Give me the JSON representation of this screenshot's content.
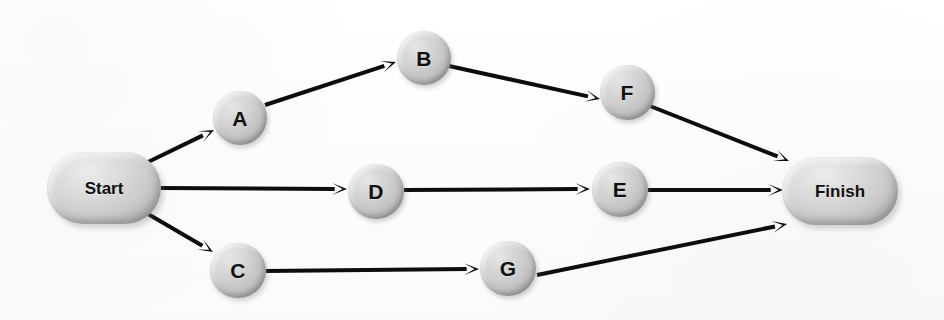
{
  "diagram": {
    "type": "directed-graph",
    "canvas": {
      "width": 944,
      "height": 320
    },
    "style": {
      "background_color": "#fdfdfd",
      "node_fill_color": "#c8c8c8",
      "node_highlight_color": "#e9e9e9",
      "node_shadow_color": "#9a9a9a",
      "edge_color": "#0d0d0d",
      "label_color": "#111111",
      "edge_width": 4,
      "arrowhead_length": 15
    },
    "nodes": [
      {
        "id": "start",
        "label": "Start",
        "shape": "stadium",
        "cx": 104,
        "cy": 188,
        "w": 114,
        "h": 72
      },
      {
        "id": "a",
        "label": "A",
        "shape": "circle",
        "cx": 240,
        "cy": 118,
        "w": 54,
        "h": 54
      },
      {
        "id": "b",
        "label": "B",
        "shape": "circle",
        "cx": 424,
        "cy": 58,
        "w": 54,
        "h": 54
      },
      {
        "id": "f",
        "label": "F",
        "shape": "circle",
        "cx": 627,
        "cy": 92,
        "w": 55,
        "h": 55
      },
      {
        "id": "d",
        "label": "D",
        "shape": "circle",
        "cx": 376,
        "cy": 191,
        "w": 56,
        "h": 55
      },
      {
        "id": "e",
        "label": "E",
        "shape": "circle",
        "cx": 620,
        "cy": 189,
        "w": 56,
        "h": 55
      },
      {
        "id": "c",
        "label": "C",
        "shape": "circle",
        "cx": 238,
        "cy": 270,
        "w": 56,
        "h": 55
      },
      {
        "id": "g",
        "label": "G",
        "shape": "circle",
        "cx": 508,
        "cy": 268,
        "w": 56,
        "h": 55
      },
      {
        "id": "finish",
        "label": "Finish",
        "shape": "stadium",
        "cx": 840,
        "cy": 191,
        "w": 116,
        "h": 68
      }
    ],
    "edges": [
      {
        "id": "start-a",
        "from": "Start",
        "to": "A",
        "x1": 146,
        "y1": 163,
        "x2": 214,
        "y2": 130
      },
      {
        "id": "a-b",
        "from": "A",
        "to": "B",
        "x1": 265,
        "y1": 105,
        "x2": 396,
        "y2": 62
      },
      {
        "id": "b-f",
        "from": "B",
        "to": "F",
        "x1": 449,
        "y1": 66,
        "x2": 600,
        "y2": 99
      },
      {
        "id": "f-finish",
        "from": "F",
        "to": "Finish",
        "x1": 650,
        "y1": 106,
        "x2": 789,
        "y2": 161
      },
      {
        "id": "start-d",
        "from": "Start",
        "to": "D",
        "x1": 160,
        "y1": 188,
        "x2": 347,
        "y2": 189
      },
      {
        "id": "d-e",
        "from": "D",
        "to": "E",
        "x1": 404,
        "y1": 190,
        "x2": 590,
        "y2": 189
      },
      {
        "id": "e-finish",
        "from": "E",
        "to": "Finish",
        "x1": 648,
        "y1": 190,
        "x2": 783,
        "y2": 190
      },
      {
        "id": "start-c",
        "from": "Start",
        "to": "C",
        "x1": 148,
        "y1": 214,
        "x2": 213,
        "y2": 252
      },
      {
        "id": "c-g",
        "from": "C",
        "to": "G",
        "x1": 266,
        "y1": 271,
        "x2": 479,
        "y2": 269
      },
      {
        "id": "g-finish",
        "from": "G",
        "to": "Finish",
        "x1": 537,
        "y1": 275,
        "x2": 787,
        "y2": 224
      }
    ]
  }
}
